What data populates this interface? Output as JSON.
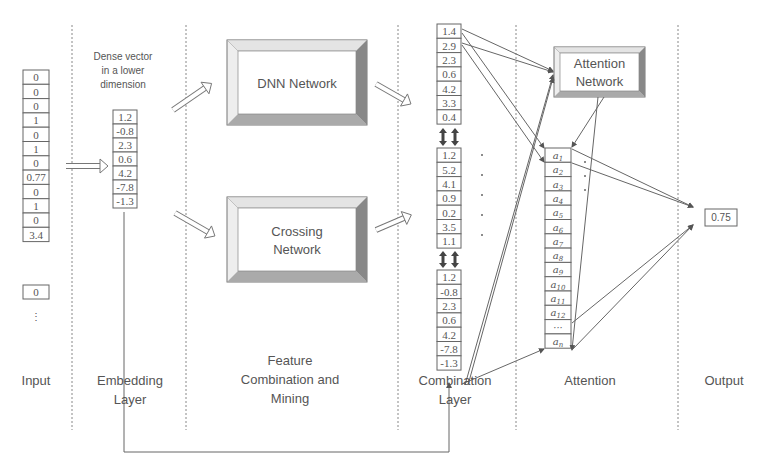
{
  "columns": [
    {
      "id": "input",
      "label": [
        "Input"
      ]
    },
    {
      "id": "embedding",
      "label": [
        "Embedding",
        "Layer"
      ]
    },
    {
      "id": "feature",
      "label": [
        "Feature",
        "Combination and",
        "Mining"
      ]
    },
    {
      "id": "combination",
      "label": [
        "Combination",
        "Layer"
      ]
    },
    {
      "id": "attention",
      "label": [
        "Attention"
      ]
    },
    {
      "id": "output",
      "label": [
        "Output"
      ]
    }
  ],
  "input_vector": [
    "0",
    "0",
    "0",
    "1",
    "0",
    "1",
    "0",
    "0.77",
    "0",
    "1",
    "0",
    "3.4"
  ],
  "input_ellipsis": "⋮",
  "input_last": "0",
  "embedding_caption": [
    "Dense vector",
    "in a lower",
    "dimension"
  ],
  "embedding_vector": [
    "1.2",
    "-0.8",
    "2.3",
    "0.6",
    "4.2",
    "-7.8",
    "-1.3"
  ],
  "networks": {
    "dnn": [
      "DNN Network"
    ],
    "crossing": [
      "Crossing",
      "Network"
    ],
    "attention": [
      "Attention",
      "Network"
    ]
  },
  "combination": {
    "dnn_out": [
      "1.4",
      "2.9",
      "2.3",
      "0.6",
      "4.2",
      "3.3",
      "0.4"
    ],
    "cross_out": [
      "1.2",
      "5.2",
      "4.1",
      "0.9",
      "0.2",
      "3.5",
      "1.1"
    ],
    "embed_copy": [
      "1.2",
      "-0.8",
      "2.3",
      "0.6",
      "4.2",
      "-7.8",
      "-1.3"
    ]
  },
  "attention_weights": [
    "a1",
    "a2",
    "a3",
    "a4",
    "a5",
    "a6",
    "a7",
    "a8",
    "a9",
    "a10",
    "a11",
    "a12",
    "...",
    "an"
  ],
  "output_value": "0.75",
  "colors": {
    "line": "#666666",
    "text": "#555555",
    "bevel_dark": "#888888",
    "bevel_light": "#c8c8c8"
  }
}
